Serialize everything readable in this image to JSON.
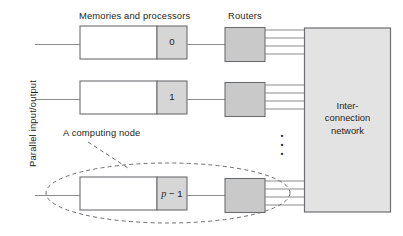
{
  "figure": {
    "title_memories": "Memories and processors",
    "title_routers": "Routers",
    "side_label": "Parallel input/output",
    "callout_label": "A computing node",
    "network_label_line1": "Inter-",
    "network_label_line2": "connection",
    "network_label_line3": "network",
    "vertical_ellipsis": "⋮",
    "colors": {
      "ink": "#231f20",
      "stroke": "#6d6e71",
      "fill_gray": "#d6d6d6",
      "fill_white": "#ffffff",
      "network_fill": "#e3e3e3",
      "background": "#ffffff"
    }
  },
  "nodes": [
    {
      "id": "node-0",
      "index_label": "0",
      "index_is_math": false
    },
    {
      "id": "node-1",
      "index_label": "1",
      "index_is_math": false
    },
    {
      "id": "node-p-1",
      "index_label": "p − 1",
      "index_is_math": true
    }
  ],
  "router_link_count": 4,
  "chart_data": {
    "type": "diagram",
    "components": [
      {
        "name": "memory-processor-box",
        "count": 3,
        "labels": [
          "0",
          "1",
          "p − 1"
        ]
      },
      {
        "name": "router",
        "count": 3
      },
      {
        "name": "interconnection-network",
        "count": 1
      },
      {
        "name": "parallel-io-lines",
        "count": 3
      },
      {
        "name": "router-to-network-links-per-router",
        "count": 4
      },
      {
        "name": "computing-node-ellipse",
        "count": 1
      },
      {
        "name": "vertical-ellipsis",
        "count": 1
      }
    ]
  }
}
